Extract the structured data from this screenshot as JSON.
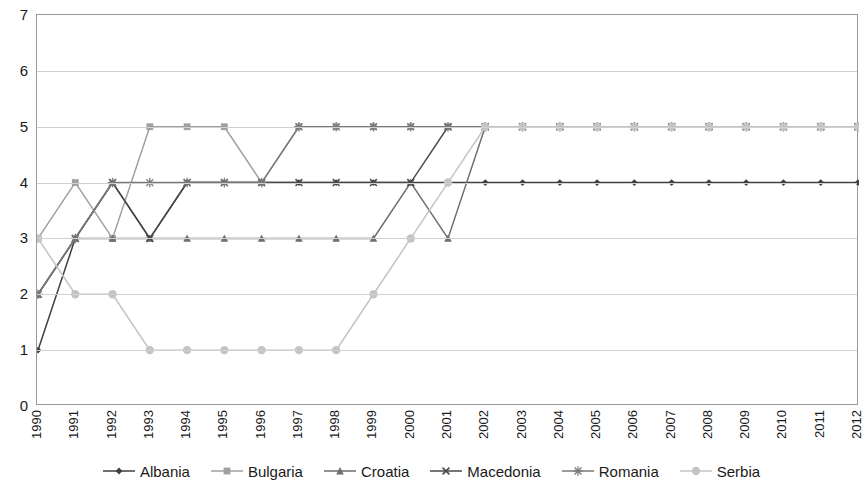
{
  "chart_data": {
    "type": "line",
    "title": "",
    "xlabel": "",
    "ylabel": "",
    "ylim": [
      0,
      7
    ],
    "ytick_labels": [
      "0",
      "1",
      "2",
      "3",
      "4",
      "5",
      "6",
      "7"
    ],
    "yticks": [
      0,
      1,
      2,
      3,
      4,
      5,
      6,
      7
    ],
    "grid": true,
    "legend_position": "bottom",
    "categories": [
      "1990",
      "1991",
      "1992",
      "1993",
      "1994",
      "1995",
      "1996",
      "1997",
      "1998",
      "1999",
      "2000",
      "2001",
      "2002",
      "2003",
      "2004",
      "2005",
      "2006",
      "2007",
      "2008",
      "2009",
      "2010",
      "2011",
      "2012"
    ],
    "series": [
      {
        "name": "Albania",
        "marker": "diamond",
        "color": "#404040",
        "values": [
          1,
          3,
          4,
          3,
          4,
          4,
          4,
          4,
          4,
          4,
          4,
          4,
          4,
          4,
          4,
          4,
          4,
          4,
          4,
          4,
          4,
          4,
          4
        ]
      },
      {
        "name": "Bulgaria",
        "marker": "square",
        "color": "#a0a0a0",
        "values": [
          3,
          4,
          3,
          5,
          5,
          5,
          4,
          5,
          5,
          5,
          5,
          5,
          5,
          5,
          5,
          5,
          5,
          5,
          5,
          5,
          5,
          5,
          5
        ]
      },
      {
        "name": "Croatia",
        "marker": "triangle",
        "color": "#6e6e6e",
        "values": [
          2,
          3,
          3,
          3,
          3,
          3,
          3,
          3,
          3,
          3,
          4,
          3,
          5,
          5,
          5,
          5,
          5,
          5,
          5,
          5,
          5,
          5,
          5
        ]
      },
      {
        "name": "Macedonia",
        "marker": "cross",
        "color": "#4a4a4a",
        "values": [
          2,
          3,
          4,
          3,
          4,
          4,
          4,
          4,
          4,
          4,
          4,
          5,
          5,
          5,
          5,
          5,
          5,
          5,
          5,
          5,
          5,
          5,
          5
        ]
      },
      {
        "name": "Romania",
        "marker": "asterisk",
        "color": "#7a7a7a",
        "values": [
          2,
          3,
          4,
          4,
          4,
          4,
          4,
          5,
          5,
          5,
          5,
          5,
          5,
          5,
          5,
          5,
          5,
          5,
          5,
          5,
          5,
          5,
          5
        ]
      },
      {
        "name": "Serbia",
        "marker": "circle",
        "color": "#c4c4c4",
        "values": [
          3,
          2,
          2,
          1,
          1,
          1,
          1,
          1,
          1,
          2,
          3,
          4,
          5,
          5,
          5,
          5,
          5,
          5,
          5,
          5,
          5,
          5,
          5
        ]
      }
    ]
  },
  "legend": {
    "items": [
      {
        "label": "Albania"
      },
      {
        "label": "Bulgaria"
      },
      {
        "label": "Croatia"
      },
      {
        "label": "Macedonia"
      },
      {
        "label": "Romania"
      },
      {
        "label": "Serbia"
      }
    ]
  }
}
